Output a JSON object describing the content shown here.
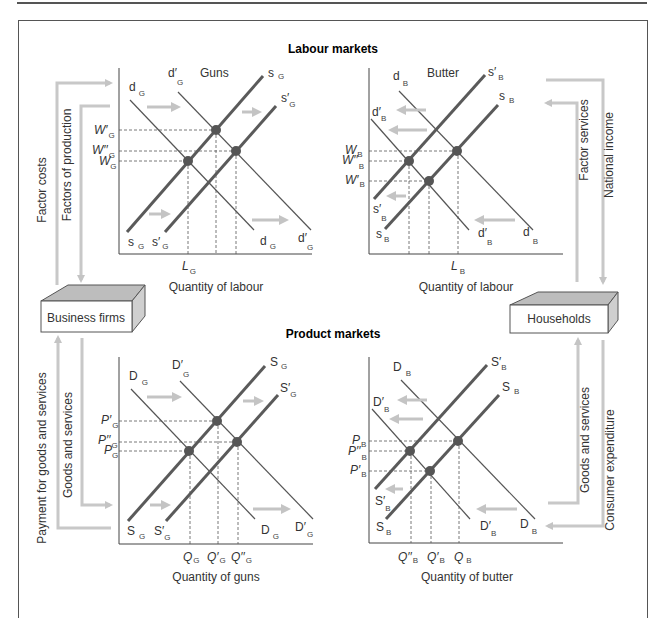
{
  "sections": {
    "labour_markets": "Labour markets",
    "product_markets": "Product markets"
  },
  "entities": {
    "business_firms": "Business firms",
    "households": "Households"
  },
  "flows": {
    "factor_costs": "Factor costs",
    "factors_of_production": "Factors of production",
    "factor_services": "Factor services",
    "national_income": "National income",
    "payment_for_goods": "Payment for goods and services",
    "goods_and_services_left": "Goods and services",
    "goods_and_services_right": "Goods and services",
    "consumer_expenditure": "Consumer expenditure"
  },
  "charts": {
    "labour_guns": {
      "title": "Guns",
      "xlabel": "Quantity of labour",
      "curves": {
        "s": "s",
        "s_prime": "s′",
        "d": "d",
        "d_prime": "d′",
        "sub": "G"
      },
      "y_ticks": {
        "w_prime": "W′",
        "w_dprime": "W′′",
        "w": "W",
        "sub": "G"
      },
      "x_ticks": {
        "l": "L",
        "sub": "G"
      }
    },
    "labour_butter": {
      "title": "Butter",
      "xlabel": "Quantity of labour",
      "curves": {
        "s": "s",
        "s_prime": "s′",
        "d": "d",
        "d_prime": "d′",
        "sub": "B"
      },
      "y_ticks": {
        "w": "W",
        "w_dprime": "W′′",
        "w_prime": "W′",
        "sub": "B"
      },
      "x_ticks": {
        "l": "L",
        "sub": "B"
      }
    },
    "product_guns": {
      "xlabel": "Quantity of guns",
      "curves": {
        "s": "S",
        "s_prime": "S′",
        "d": "D",
        "d_prime": "D′",
        "sub": "G"
      },
      "y_ticks": {
        "p_prime": "P′",
        "p_dprime": "P′′",
        "p": "P",
        "sub": "G"
      },
      "x_ticks": {
        "q": "Q",
        "q_prime": "Q′",
        "q_dprime": "Q′′",
        "sub": "G"
      }
    },
    "product_butter": {
      "xlabel": "Quantity of butter",
      "curves": {
        "s": "S",
        "s_prime": "S′",
        "d": "D",
        "d_prime": "D′",
        "sub": "B"
      },
      "y_ticks": {
        "p": "P",
        "p_dprime": "P′′",
        "p_prime": "P′",
        "sub": "B"
      },
      "x_ticks": {
        "q_dprime": "Q′′",
        "q_prime": "Q′",
        "q": "Q",
        "sub": "B"
      }
    }
  },
  "colors": {
    "curve": "#555555",
    "supply_curve": "#5a5a5a",
    "point": "#555555",
    "flow_arrow": "#c8c8c8",
    "shift_arrow": "#c0c0c0",
    "axis": "#444444"
  }
}
